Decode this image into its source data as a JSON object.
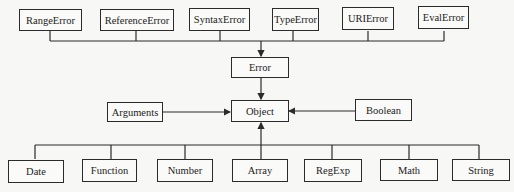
{
  "diagram": {
    "top_row": [
      "RangeError",
      "ReferenceError",
      "SyntaxError",
      "TypeError",
      "URIError",
      "EvalError"
    ],
    "middle": {
      "error": "Error",
      "object": "Object",
      "arguments": "Arguments",
      "boolean": "Boolean"
    },
    "bottom_row": [
      "Date",
      "Function",
      "Number",
      "Array",
      "RegExp",
      "Math",
      "String"
    ],
    "edges": [
      {
        "from": "RangeError",
        "to": "Error"
      },
      {
        "from": "ReferenceError",
        "to": "Error"
      },
      {
        "from": "SyntaxError",
        "to": "Error"
      },
      {
        "from": "TypeError",
        "to": "Error"
      },
      {
        "from": "URIError",
        "to": "Error"
      },
      {
        "from": "EvalError",
        "to": "Error"
      },
      {
        "from": "Error",
        "to": "Object"
      },
      {
        "from": "Arguments",
        "to": "Object"
      },
      {
        "from": "Boolean",
        "to": "Object"
      },
      {
        "from": "Date",
        "to": "Object"
      },
      {
        "from": "Function",
        "to": "Object"
      },
      {
        "from": "Number",
        "to": "Object"
      },
      {
        "from": "Array",
        "to": "Object"
      },
      {
        "from": "RegExp",
        "to": "Object"
      },
      {
        "from": "Math",
        "to": "Object"
      },
      {
        "from": "String",
        "to": "Object"
      }
    ],
    "colors": {
      "line": "#2b2b2b",
      "background": "#f7f7f5"
    }
  }
}
